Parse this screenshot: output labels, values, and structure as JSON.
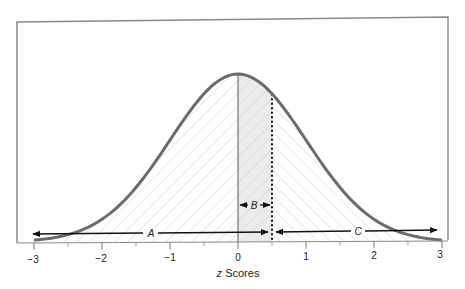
{
  "chart_data": {
    "type": "area",
    "title": "",
    "subtitle": "",
    "xlabel": "z Scores",
    "xlabel_italic_part": "z",
    "xlabel_rest": " Scores",
    "ylabel": "",
    "xlim": [
      -3,
      3
    ],
    "x_ticks": [
      -3,
      -2,
      -1,
      0,
      1,
      2,
      3
    ],
    "x_tick_labels": [
      "−3",
      "−2",
      "−1",
      "0",
      "1",
      "2",
      "3"
    ],
    "minor_ticks": [
      -2.5,
      -1.5,
      -0.5,
      0.5,
      1.5,
      2.5
    ],
    "grid": false,
    "legend": null,
    "curve": {
      "distribution": "standard normal",
      "mean": 0,
      "sd": 1,
      "color": "#6b6b6b"
    },
    "reference_lines": [
      {
        "z": 0,
        "style": "solid",
        "color": "#555555"
      },
      {
        "z": 0.5,
        "style": "dotted",
        "color": "#111111"
      }
    ],
    "regions": [
      {
        "label": "A",
        "from": -3,
        "to": 0.5,
        "hatch": "forward-diagonal",
        "description": "area to the left of z = 0.5"
      },
      {
        "label": "B",
        "from": 0,
        "to": 0.5,
        "fill": "#ebebeb",
        "description": "area between mean and z = 0.5"
      },
      {
        "label": "C",
        "from": 0.5,
        "to": 3,
        "hatch": "back-diagonal",
        "description": "area to the right of z = 0.5"
      }
    ],
    "annotations": [
      {
        "text": "A",
        "type": "double-arrow",
        "from": -3,
        "to": 0.5
      },
      {
        "text": "B",
        "type": "double-arrow",
        "from": 0,
        "to": 0.5
      },
      {
        "text": "C",
        "type": "double-arrow",
        "from": 0.5,
        "to": 3
      }
    ]
  },
  "labels": {
    "region_a": "A",
    "region_b": "B",
    "region_c": "C",
    "x_axis_z": "z",
    "x_axis_rest": " Scores",
    "tick_m3": "−3",
    "tick_m2": "−2",
    "tick_m1": "−1",
    "tick_0": "0",
    "tick_1": "1",
    "tick_2": "2",
    "tick_3": "3"
  },
  "colors": {
    "frame": "#8a8a8a",
    "curve": "#6b6b6b",
    "hatch": "#cfcfcf",
    "region_b_fill": "#ececec",
    "arrow": "#111111"
  }
}
